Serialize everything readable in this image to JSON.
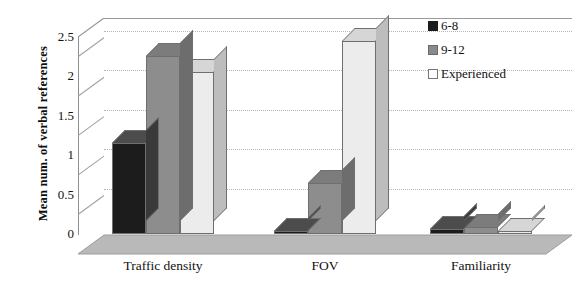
{
  "chart_data": {
    "type": "bar",
    "title": "",
    "subtitle": "",
    "xlabel": "",
    "ylabel": "Mean num. of verbal references",
    "categories": [
      "Traffic density",
      "FOV",
      "Familiarity"
    ],
    "series": [
      {
        "name": "6-8",
        "color": "#1c1c1c",
        "values": [
          1.15,
          0.03,
          0.06
        ]
      },
      {
        "name": "9-12",
        "color": "#8d8d8d",
        "values": [
          2.25,
          0.65,
          0.09
        ]
      },
      {
        "name": "Experienced",
        "color": "#ececec",
        "values": [
          2.05,
          2.45,
          0.02
        ]
      }
    ],
    "ylim": [
      0,
      2.75
    ],
    "yticks": [
      "0",
      "0.5",
      "1",
      "1.5",
      "2",
      "2.5"
    ],
    "ytick_values": [
      0,
      0.5,
      1,
      1.5,
      2,
      2.5
    ],
    "grid": true,
    "grid_axis": "y",
    "legend_position": "top-right",
    "three_d": true
  },
  "legend": {
    "items": [
      {
        "label": "6-8"
      },
      {
        "label": "9-12"
      },
      {
        "label": "Experienced"
      }
    ]
  }
}
